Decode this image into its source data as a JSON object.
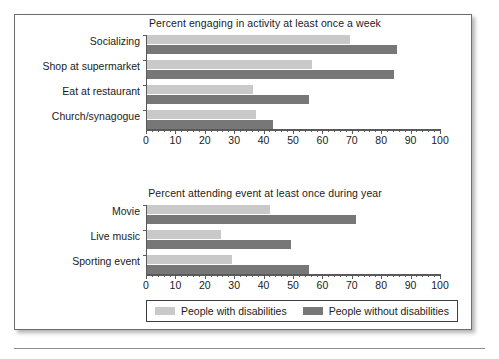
{
  "figure": {
    "legend": {
      "entries": [
        {
          "label": "People with disabilities",
          "color": "#c9c9c9"
        },
        {
          "label": "People without disabilities",
          "color": "#777777"
        }
      ]
    }
  },
  "chart_data": [
    {
      "type": "bar",
      "orientation": "horizontal",
      "title": "Percent engaging in activity at least once a week",
      "xlabel": "",
      "ylabel": "",
      "xlim": [
        0,
        100
      ],
      "xticks": [
        0,
        10,
        20,
        30,
        40,
        50,
        60,
        70,
        80,
        90,
        100
      ],
      "xticklabels": [
        "0",
        "10",
        "20",
        "30",
        "40",
        "50",
        "60",
        "70",
        "80",
        "90",
        "100"
      ],
      "grid": false,
      "legend_position": "below-figure",
      "categories": [
        "Socializing",
        "Shop at supermarket",
        "Eat at restaurant",
        "Church/synagogue"
      ],
      "series": [
        {
          "name": "People with disabilities",
          "color": "#c9c9c9",
          "values": [
            69,
            56,
            36,
            37
          ]
        },
        {
          "name": "People without disabilities",
          "color": "#777777",
          "values": [
            85,
            84,
            55,
            43
          ]
        }
      ]
    },
    {
      "type": "bar",
      "orientation": "horizontal",
      "title": "Percent attending event at least once during year",
      "xlabel": "",
      "ylabel": "",
      "xlim": [
        0,
        100
      ],
      "xticks": [
        0,
        10,
        20,
        30,
        40,
        50,
        60,
        70,
        80,
        90,
        100
      ],
      "xticklabels": [
        "0",
        "10",
        "20",
        "30",
        "40",
        "50",
        "60",
        "70",
        "80",
        "90",
        "100"
      ],
      "grid": false,
      "legend_position": "below-figure",
      "categories": [
        "Movie",
        "Live music",
        "Sporting event"
      ],
      "series": [
        {
          "name": "People with disabilities",
          "color": "#c9c9c9",
          "values": [
            42,
            25,
            29
          ]
        },
        {
          "name": "People without disabilities",
          "color": "#777777",
          "values": [
            71,
            49,
            55
          ]
        }
      ]
    }
  ]
}
